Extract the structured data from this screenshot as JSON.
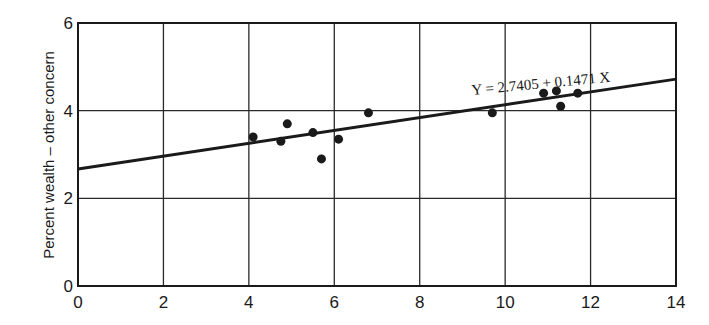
{
  "chart_data": {
    "type": "scatter",
    "title": "",
    "xlabel": "",
    "ylabel": "Percent wealth – other concern",
    "xlim": [
      0,
      14
    ],
    "ylim": [
      0,
      6
    ],
    "x_ticks": [
      0,
      2,
      4,
      6,
      8,
      10,
      12,
      14
    ],
    "y_ticks": [
      0,
      2,
      4,
      6
    ],
    "grid": true,
    "legend": null,
    "series": [
      {
        "name": "observations",
        "marker": "filled-circle",
        "points": [
          {
            "x": 4.1,
            "y": 3.4
          },
          {
            "x": 4.75,
            "y": 3.3
          },
          {
            "x": 4.9,
            "y": 3.7
          },
          {
            "x": 5.5,
            "y": 3.5
          },
          {
            "x": 5.7,
            "y": 2.9
          },
          {
            "x": 6.1,
            "y": 3.35
          },
          {
            "x": 6.8,
            "y": 3.95
          },
          {
            "x": 9.7,
            "y": 3.95
          },
          {
            "x": 10.9,
            "y": 4.4
          },
          {
            "x": 11.2,
            "y": 4.45
          },
          {
            "x": 11.3,
            "y": 4.1
          },
          {
            "x": 11.7,
            "y": 4.4
          }
        ]
      }
    ],
    "regression_line": {
      "intercept": 2.7405,
      "slope": 0.1471,
      "label": "Y = 2.7405 + 0.1471 X",
      "x_range": [
        0,
        14
      ]
    },
    "annotations": [
      {
        "text": "Y = 2.7405 + 0.1471 X",
        "x": 9.2,
        "y": 4.6
      }
    ]
  }
}
